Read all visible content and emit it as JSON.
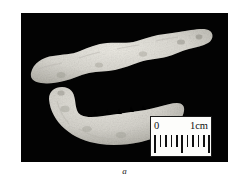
{
  "figure": {
    "caption_label": "a",
    "plate": {
      "name": "specimen-photograph",
      "background_color": "#030303",
      "description": "Two pale fossil mandible specimens photographed on a black background"
    },
    "specimens": [
      {
        "id": "upper-specimen",
        "label": "elongated mandible fragment",
        "color": "#d8d6cf"
      },
      {
        "id": "lower-specimen",
        "label": "curved mandible with tooth notches",
        "color": "#d6d4cd"
      }
    ],
    "scale_bar": {
      "name": "scale-bar",
      "zero_label": "0",
      "max_label": "1cm",
      "tick_count": 11,
      "major_tick_indices": [
        0,
        5,
        10
      ],
      "box_color": "#fdfdfb",
      "ink_color": "#101010"
    }
  }
}
